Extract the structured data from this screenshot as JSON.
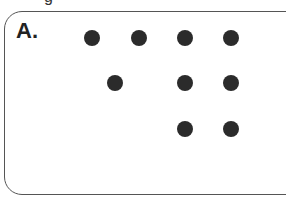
{
  "figure": {
    "partial_header_glyph": "g",
    "panel_label": "A.",
    "dot_color": "#2b2b2b",
    "rows": [
      {
        "row": 1,
        "dots": [
          {
            "x": 92,
            "y": 38
          },
          {
            "x": 139,
            "y": 38
          },
          {
            "x": 185,
            "y": 38
          },
          {
            "x": 231,
            "y": 38
          }
        ]
      },
      {
        "row": 2,
        "dots": [
          {
            "x": 115,
            "y": 83
          },
          {
            "x": 185,
            "y": 83
          },
          {
            "x": 231,
            "y": 83
          }
        ]
      },
      {
        "row": 3,
        "dots": [
          {
            "x": 185,
            "y": 129
          },
          {
            "x": 231,
            "y": 129
          }
        ]
      }
    ],
    "dot_counts": [
      4,
      3,
      2
    ]
  }
}
